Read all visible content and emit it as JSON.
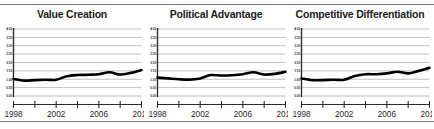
{
  "figure": {
    "name": "small-multiples-trend-figure",
    "rule_color": "#7a7a7a",
    "panel_count": 3
  },
  "chart_data": [
    {
      "type": "line",
      "title": "Value Creation",
      "xlabel": "",
      "ylabel": "",
      "xlim": [
        1998,
        2010
      ],
      "ylim": [
        0.0,
        4.0
      ],
      "grid": true,
      "legend": false,
      "grid_color": "#b4b4b4",
      "line_color": "#000000",
      "line_width": 2.6,
      "yticks": [
        "0.00",
        "0.50",
        "1.00",
        "1.50",
        "2.00",
        "2.50",
        "3.00",
        "3.50",
        "4.00"
      ],
      "ytick_values": [
        0.0,
        0.5,
        1.0,
        1.5,
        2.0,
        2.5,
        3.0,
        3.5,
        4.0
      ],
      "xticks": [
        "1998",
        "2002",
        "2006",
        "2010"
      ],
      "xtick_values": [
        1998,
        2002,
        2006,
        2010
      ],
      "minor_xtick_values": [
        1998,
        2000,
        2002,
        2004,
        2006,
        2008,
        2010
      ],
      "x": [
        1998,
        1999,
        2000,
        2001,
        2002,
        2003,
        2004,
        2005,
        2006,
        2007,
        2008,
        2009,
        2010
      ],
      "values": [
        1.02,
        0.92,
        0.95,
        0.97,
        0.97,
        1.18,
        1.25,
        1.27,
        1.3,
        1.42,
        1.28,
        1.38,
        1.55
      ]
    },
    {
      "type": "line",
      "title": "Political Advantage",
      "xlabel": "",
      "ylabel": "",
      "xlim": [
        1998,
        2010
      ],
      "ylim": [
        0.0,
        4.0
      ],
      "grid": true,
      "legend": false,
      "grid_color": "#b4b4b4",
      "line_color": "#000000",
      "line_width": 2.6,
      "yticks": [
        "0.00",
        "0.50",
        "1.00",
        "1.50",
        "2.00",
        "2.50",
        "3.00",
        "3.50",
        "4.00"
      ],
      "ytick_values": [
        0.0,
        0.5,
        1.0,
        1.5,
        2.0,
        2.5,
        3.0,
        3.5,
        4.0
      ],
      "xticks": [
        "1998",
        "2002",
        "2006",
        "2010"
      ],
      "xtick_values": [
        1998,
        2002,
        2006,
        2010
      ],
      "minor_xtick_values": [
        1998,
        2000,
        2002,
        2004,
        2006,
        2008,
        2010
      ],
      "x": [
        1998,
        1999,
        2000,
        2001,
        2002,
        2003,
        2004,
        2005,
        2006,
        2007,
        2008,
        2009,
        2010
      ],
      "values": [
        1.1,
        1.05,
        1.0,
        0.98,
        1.05,
        1.25,
        1.22,
        1.24,
        1.3,
        1.42,
        1.28,
        1.32,
        1.45
      ]
    },
    {
      "type": "line",
      "title": "Competitive Differentiation",
      "xlabel": "",
      "ylabel": "",
      "xlim": [
        1998,
        2010
      ],
      "ylim": [
        0.0,
        4.0
      ],
      "grid": true,
      "legend": false,
      "grid_color": "#b4b4b4",
      "line_color": "#000000",
      "line_width": 2.6,
      "yticks": [
        "0.00",
        "0.50",
        "1.00",
        "1.50",
        "2.00",
        "2.50",
        "3.00",
        "3.50",
        "4.00"
      ],
      "ytick_values": [
        0.0,
        0.5,
        1.0,
        1.5,
        2.0,
        2.5,
        3.0,
        3.5,
        4.0
      ],
      "xticks": [
        "1998",
        "2002",
        "2006",
        "2010"
      ],
      "xtick_values": [
        1998,
        2002,
        2006,
        2010
      ],
      "minor_xtick_values": [
        1998,
        2000,
        2002,
        2004,
        2006,
        2008,
        2010
      ],
      "x": [
        1998,
        1999,
        2000,
        2001,
        2002,
        2003,
        2004,
        2005,
        2006,
        2007,
        2008,
        2009,
        2010
      ],
      "values": [
        1.05,
        0.95,
        0.95,
        0.97,
        0.97,
        1.2,
        1.3,
        1.3,
        1.35,
        1.45,
        1.35,
        1.5,
        1.68
      ]
    }
  ]
}
